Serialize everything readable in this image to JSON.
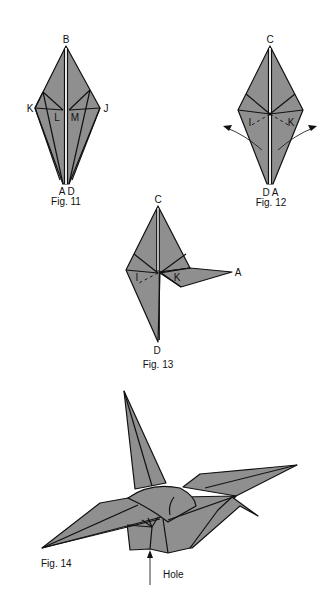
{
  "colors": {
    "paper_fill": "#8f8f8f",
    "line": "#111111",
    "background": "#ffffff"
  },
  "figures": [
    {
      "id": "fig11",
      "caption": "Fig. 11",
      "labels": {
        "top": "B",
        "left": "K",
        "right": "J",
        "inner_left": "L",
        "inner_right": "M",
        "bottom_left": "A",
        "bottom_right": "D"
      }
    },
    {
      "id": "fig12",
      "caption": "Fig. 12",
      "labels": {
        "top": "C",
        "inner_left": "I",
        "inner_right": "K",
        "bottom_left": "D",
        "bottom_right": "A"
      }
    },
    {
      "id": "fig13",
      "caption": "Fig. 13",
      "labels": {
        "top": "C",
        "inner_left": "I",
        "inner_right": "K",
        "right_tip": "A",
        "bottom": "D"
      }
    },
    {
      "id": "fig14",
      "caption": "Fig. 14",
      "annotation": "Hole"
    }
  ]
}
